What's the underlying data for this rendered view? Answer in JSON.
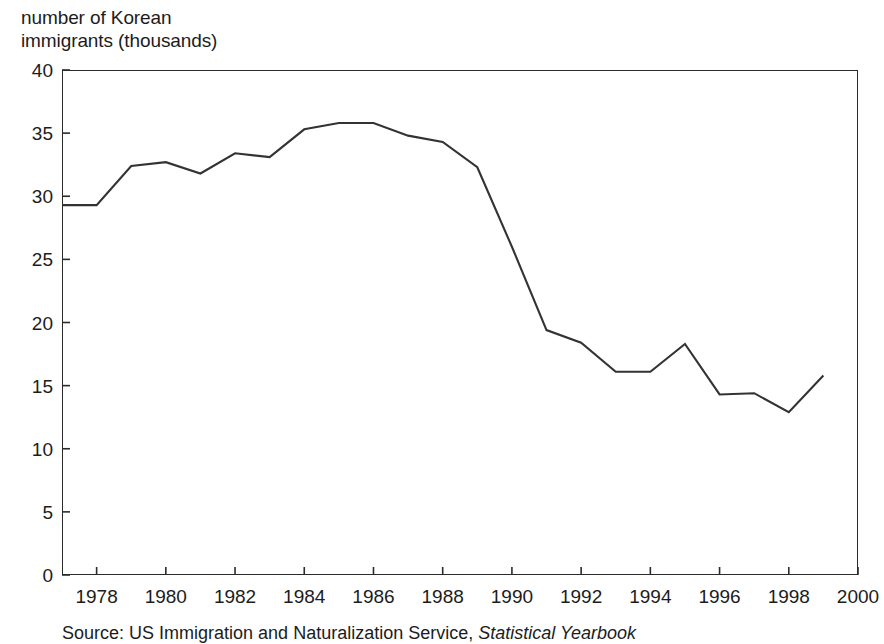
{
  "chart_data": {
    "type": "line",
    "title": "",
    "ylabel": "number of Korean immigrants (thousands)",
    "xlabel": "",
    "ylim": [
      0,
      40
    ],
    "xlim": [
      1977,
      2000
    ],
    "grid": false,
    "legend": null,
    "x": [
      1977,
      1978,
      1979,
      1980,
      1981,
      1982,
      1983,
      1984,
      1985,
      1986,
      1987,
      1988,
      1989,
      1990,
      1991,
      1992,
      1993,
      1994,
      1995,
      1996,
      1997,
      1998,
      1999
    ],
    "series": [
      {
        "name": "Korean immigrants",
        "values": [
          29.3,
          29.3,
          32.4,
          32.7,
          31.8,
          33.4,
          33.1,
          35.3,
          35.8,
          35.8,
          34.8,
          34.3,
          32.3,
          26.0,
          19.4,
          18.4,
          16.1,
          16.1,
          18.3,
          14.3,
          14.4,
          12.9,
          15.8
        ]
      }
    ],
    "line_color": "#333333",
    "axis_color": "#2b2b2b",
    "ytick_values": [
      0,
      5,
      10,
      15,
      20,
      25,
      30,
      35,
      40
    ],
    "ytick_labels": [
      "0",
      "5",
      "10",
      "15",
      "20",
      "25",
      "30",
      "35",
      "40"
    ],
    "xtick_values": [
      1978,
      1980,
      1982,
      1984,
      1986,
      1988,
      1990,
      1992,
      1994,
      1996,
      1998,
      2000
    ],
    "xtick_labels": [
      "1978",
      "1980",
      "1982",
      "1984",
      "1986",
      "1988",
      "1990",
      "1992",
      "1994",
      "1996",
      "1998",
      "2000"
    ]
  },
  "axis_title": {
    "text": "number of Korean\nimmigrants (thousands)"
  },
  "source": {
    "prefix": "Source:",
    "agency": "US Immigration and Naturalization Service,",
    "publication": "Statistical Yearbook"
  }
}
